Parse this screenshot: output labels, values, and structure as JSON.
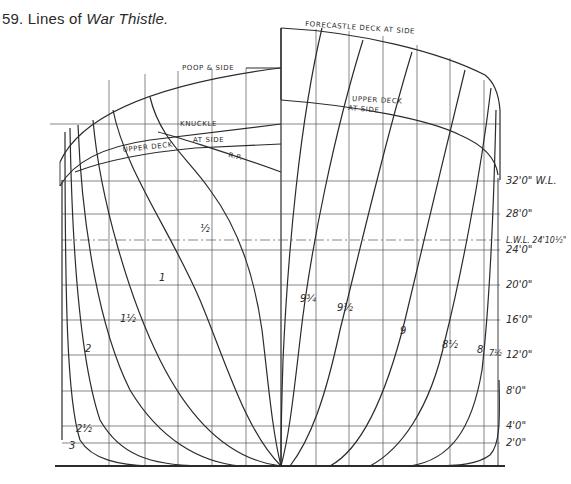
{
  "caption": {
    "number": "59. Lines of ",
    "title": "War Thistle."
  },
  "deck_labels": {
    "poop": "POOP & SIDE",
    "forecastle": "FORECASTLE DECK AT SIDE",
    "knuckle": "KNUCKLE",
    "upper_deck_left": "UPPER DECK",
    "at_side_left": "AT SIDE",
    "rp": "R.P.",
    "upper_deck_right": "UPPER DECK",
    "at_side_right": "AT SIDE"
  },
  "waterlines": [
    {
      "label": "32'0\" W.L.",
      "y": 181
    },
    {
      "label": "28'0\"",
      "y": 214
    },
    {
      "label": "L.W.L. 24'10½\"",
      "y": 240
    },
    {
      "label": "24'0\"",
      "y": 250
    },
    {
      "label": "20'0\"",
      "y": 285
    },
    {
      "label": "16'0\"",
      "y": 320
    },
    {
      "label": "12'0\"",
      "y": 355
    },
    {
      "label": "8'0\"",
      "y": 391
    },
    {
      "label": "4'0\"",
      "y": 426
    },
    {
      "label": "2'0\"",
      "y": 443
    }
  ],
  "stations_aft": [
    {
      "label": "½",
      "x": 200,
      "y": 232
    },
    {
      "label": "1",
      "x": 159,
      "y": 281
    },
    {
      "label": "1½",
      "x": 120,
      "y": 322
    },
    {
      "label": "2",
      "x": 85,
      "y": 352
    },
    {
      "label": "2½",
      "x": 76,
      "y": 432
    },
    {
      "label": "3",
      "x": 69,
      "y": 449
    }
  ],
  "stations_fore": [
    {
      "label": "9¾",
      "x": 300,
      "y": 302
    },
    {
      "label": "9½",
      "x": 337,
      "y": 311
    },
    {
      "label": "9",
      "x": 400,
      "y": 334
    },
    {
      "label": "8½",
      "x": 442,
      "y": 348
    },
    {
      "label": "8",
      "x": 477,
      "y": 353
    },
    {
      "label": "7½",
      "x": 491,
      "y": 356
    }
  ]
}
